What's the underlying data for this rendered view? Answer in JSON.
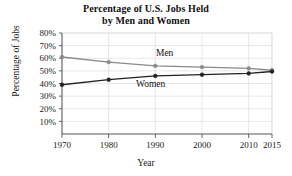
{
  "chart_data": {
    "type": "line",
    "title": "Percentage of U.S. Jobs Held by Men and Women",
    "title_line1": "Percentage of U.S. Jobs Held",
    "title_line2": "by Men and Women",
    "xlabel": "Year",
    "ylabel": "Percentage of Jobs",
    "x": [
      1970,
      1980,
      1990,
      2000,
      2010,
      2015
    ],
    "categories": [
      "1970",
      "1980",
      "1990",
      "2000",
      "2010",
      "2015"
    ],
    "xtick_labels": [
      "1970",
      "1980",
      "1990",
      "2000",
      "2010",
      "2015"
    ],
    "ytick_labels": [
      "10%",
      "20%",
      "30%",
      "40%",
      "50%",
      "60%",
      "70%",
      "80%"
    ],
    "ytick_values": [
      10,
      20,
      30,
      40,
      50,
      60,
      70,
      80
    ],
    "xlim": [
      1970,
      2015
    ],
    "ylim": [
      0,
      80
    ],
    "grid": true,
    "legend_position": "inline-annotation",
    "series": [
      {
        "name": "Men",
        "label": "Men",
        "color": "#8a8a8a",
        "marker": "circle",
        "values": [
          61,
          57,
          54,
          53,
          52,
          50.5
        ],
        "label_x": 1992,
        "label_y": 62
      },
      {
        "name": "Women",
        "label": "Women",
        "color": "#222222",
        "marker": "circle",
        "values": [
          39,
          43,
          46,
          47,
          48,
          49.5
        ],
        "label_x": 1989,
        "label_y": 37
      }
    ],
    "axis_color": "#555555",
    "grid_color": "#d8d8d8"
  }
}
